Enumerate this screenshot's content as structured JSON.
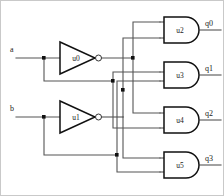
{
  "diagram": {
    "background_color": "#ffffff",
    "wire_color": "#555555",
    "gate_outline_color": "#111111",
    "text_color": "#1a1a1a",
    "frame_color": "#c9c9c9"
  },
  "inputs": [
    {
      "id": "a",
      "label": "a",
      "x": 10,
      "y": 52
    },
    {
      "id": "b",
      "label": "b",
      "x": 10,
      "y": 111
    }
  ],
  "outputs": [
    {
      "id": "q0",
      "label": "q0",
      "x": 205,
      "y": 22
    },
    {
      "id": "q1",
      "label": "q1",
      "x": 205,
      "y": 67
    },
    {
      "id": "q2",
      "label": "q2",
      "x": 205,
      "y": 112
    },
    {
      "id": "q3",
      "label": "q3",
      "x": 205,
      "y": 157
    }
  ],
  "gates": [
    {
      "id": "u0",
      "label": "u0",
      "type": "inverter",
      "cx": 76,
      "cy": 58
    },
    {
      "id": "u1",
      "label": "u1",
      "type": "inverter",
      "cx": 76,
      "cy": 117
    },
    {
      "id": "u2",
      "label": "u2",
      "type": "and",
      "cx": 180,
      "cy": 30
    },
    {
      "id": "u3",
      "label": "u3",
      "type": "and",
      "cx": 180,
      "cy": 75
    },
    {
      "id": "u4",
      "label": "u4",
      "type": "and",
      "cx": 180,
      "cy": 120
    },
    {
      "id": "u5",
      "label": "u5",
      "type": "and",
      "cx": 180,
      "cy": 165
    }
  ],
  "junctions": [
    {
      "id": "j-a-branch",
      "x": 44,
      "y": 58
    },
    {
      "id": "j-b-branch",
      "x": 44,
      "y": 117
    },
    {
      "id": "j-not-a-bus",
      "x": 133,
      "y": 58
    },
    {
      "id": "j-a-bus",
      "x": 113,
      "y": 81
    },
    {
      "id": "j-not-b-bus",
      "x": 123,
      "y": 90
    },
    {
      "id": "j-b-bus",
      "x": 117,
      "y": 155
    }
  ],
  "nets": [
    {
      "id": "net-a",
      "from": "a",
      "to": "u0.in"
    },
    {
      "id": "net-a-tap",
      "from": "a",
      "to": "u3.in-b"
    },
    {
      "id": "net-not-a",
      "from": "u0.out",
      "to": "bus-not-a"
    },
    {
      "id": "net-b",
      "from": "b",
      "to": "u1.in"
    },
    {
      "id": "net-b-tap",
      "from": "b",
      "to": "u5.in-b"
    },
    {
      "id": "net-not-b",
      "from": "u1.out",
      "to": "bus-not-b"
    }
  ]
}
